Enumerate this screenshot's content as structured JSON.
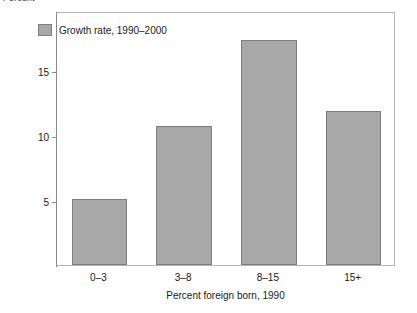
{
  "chart_data": {
    "type": "bar",
    "title": "",
    "subtitle": "",
    "categories": [
      "0–3",
      "3–8",
      "8–15",
      "15+"
    ],
    "values": [
      5.1,
      10.7,
      17.3,
      11.8
    ],
    "series": [
      {
        "name": "Growth rate, 1990–2000",
        "values": [
          5.1,
          10.7,
          17.3,
          11.8
        ],
        "color": "#a8a8a8"
      }
    ],
    "xlabel": "Percent foreign born, 1990",
    "ylabel": "Percent",
    "ylim": [
      0,
      19.5
    ],
    "yticks": [
      5,
      10,
      15
    ],
    "ytick_labels": [
      "5",
      "10",
      "15"
    ],
    "grid": false,
    "legend": {
      "position": "top-left-inside",
      "entries": [
        {
          "label": "Growth rate, 1990–2000",
          "color": "#a8a8a8"
        }
      ]
    },
    "frame": true
  },
  "axes": {
    "y_unit_caption": "Percent",
    "x_title": "Percent foreign born, 1990"
  },
  "legend": {
    "entry_label": "Growth rate, 1990–2000"
  },
  "colors": {
    "bar_fill": "#a8a8a8",
    "bar_stroke": "#7d7d7d",
    "frame": "#b4b4b4",
    "axis": "#8a8a8a",
    "text": "#1a1a1a",
    "background": "#ffffff"
  }
}
